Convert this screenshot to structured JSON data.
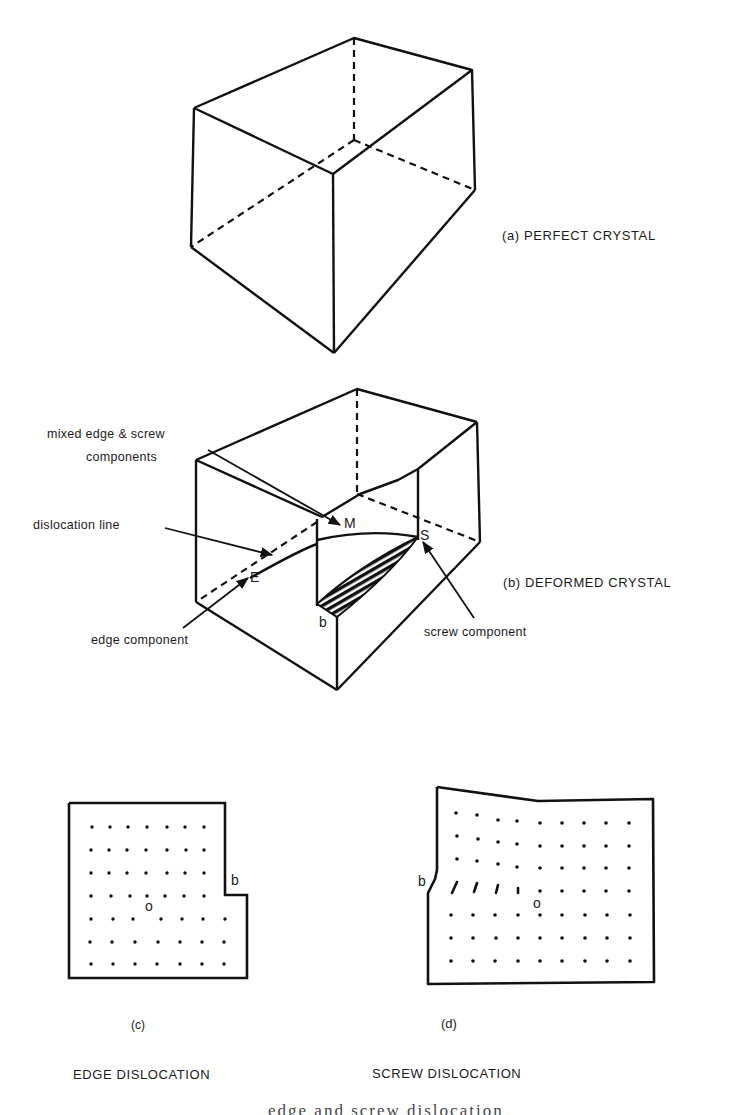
{
  "figure": {
    "panel_a": {
      "caption": "(a) PERFECT CRYSTAL"
    },
    "panel_b": {
      "caption": "(b) DEFORMED CRYSTAL",
      "annotations": {
        "mixed": [
          "mixed edge & screw",
          "components"
        ],
        "dislocation_line": "dislocation line",
        "edge_component": "edge component",
        "screw_component": "screw component"
      },
      "symbols": {
        "M": "M",
        "S": "S",
        "E": "E",
        "b": "b"
      }
    },
    "panel_c": {
      "letter": "(c)",
      "caption": "EDGE DISLOCATION",
      "symbols": {
        "b": "b",
        "o": "o"
      },
      "lattice": {
        "rows": 7,
        "cols_top": 7,
        "cols_bottom": 7
      }
    },
    "panel_d": {
      "letter": "(d)",
      "caption": "SCREW DISLOCATION",
      "symbols": {
        "b": "b",
        "o": "o"
      },
      "lattice": {
        "rows": 7,
        "cols": 9
      }
    },
    "footer_partial_text": "edge and screw dislocation"
  }
}
